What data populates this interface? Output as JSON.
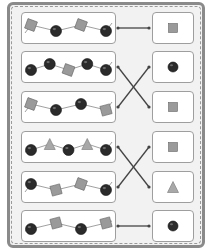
{
  "worksheet": {
    "title": "",
    "colors": {
      "frame": "#8a8a8a",
      "background": "#f2f2f2",
      "box_border": "#9e9e9e",
      "bead_ball": "#2b2b2b",
      "bead_square": "#9a9a9a",
      "bead_triangle": "#a8a8a8",
      "line": "#444444"
    },
    "rows": [
      {
        "pattern": [
          "square",
          "ball",
          "square",
          "ball"
        ],
        "answer": "square",
        "match_to_row": 0
      },
      {
        "pattern": [
          "ball",
          "ball",
          "square",
          "ball",
          "ball"
        ],
        "answer": "ball",
        "match_to_row": 2
      },
      {
        "pattern": [
          "square",
          "ball",
          "ball",
          "square"
        ],
        "answer": "square",
        "match_to_row": 1
      },
      {
        "pattern": [
          "ball",
          "triangle",
          "ball",
          "triangle",
          "ball"
        ],
        "answer": "square",
        "match_to_row": 4
      },
      {
        "pattern": [
          "ball",
          "square",
          "square",
          "ball"
        ],
        "answer": "triangle",
        "match_to_row": 3
      },
      {
        "pattern": [
          "ball",
          "square",
          "ball",
          "square"
        ],
        "answer": "ball",
        "match_to_row": 5
      }
    ]
  }
}
